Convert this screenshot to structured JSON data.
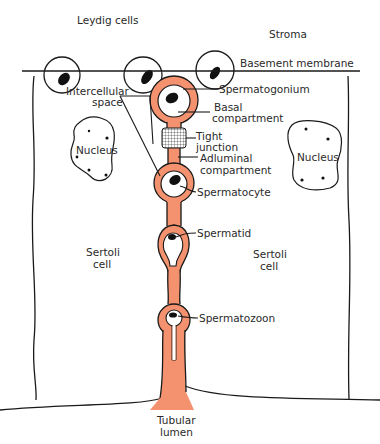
{
  "diagram": {
    "colors": {
      "cytoplasm": "#f4926f",
      "outline": "#1a1a1a",
      "nucleus": "#111111",
      "background": "#ffffff"
    },
    "labels": {
      "leydig": "Leydig cells",
      "stroma": "Stroma",
      "basement": "Basement membrane",
      "intercellular_1": "Intercellular",
      "intercellular_2": "space",
      "spermatogonium": "Spermatogonium",
      "basal_1": "Basal",
      "basal_2": "compartment",
      "tight_1": "Tight",
      "tight_2": "junction",
      "adluminal_1": "Adluminal",
      "adluminal_2": "compartment",
      "spermatocyte": "Spermatocyte",
      "spermatid": "Spermatid",
      "spermatozoon": "Spermatozoon",
      "nucleus_left": "Nucleus",
      "nucleus_right": "Nucleus",
      "sertoli_left_1": "Sertoli",
      "sertoli_left_2": "cell",
      "sertoli_right_1": "Sertoli",
      "sertoli_right_2": "cell",
      "lumen_1": "Tubular",
      "lumen_2": "lumen"
    }
  }
}
